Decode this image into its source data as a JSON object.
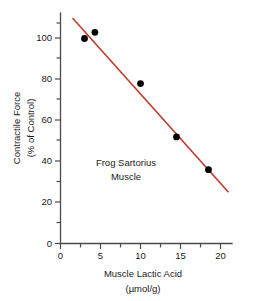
{
  "chart_data": {
    "type": "scatter",
    "title": "",
    "xlabel": "Muscle Lactic Acid",
    "xlabel_units": "(µmol/g)",
    "ylabel": "Contractile Force",
    "ylabel_units": "(% of Control)",
    "xlim": [
      0,
      21.5
    ],
    "ylim": [
      0,
      112
    ],
    "grid": false,
    "legend": "none",
    "x_ticks": [
      0,
      5,
      10,
      15,
      20
    ],
    "x_tick_labels": [
      "0",
      "5",
      "10",
      "15",
      "20"
    ],
    "x_minor_ticks": [
      2.5,
      7.5,
      12.5,
      17.5
    ],
    "y_ticks": [
      0,
      20,
      40,
      60,
      80,
      100
    ],
    "y_tick_labels": [
      "0",
      "20",
      "40",
      "60",
      "80",
      "100"
    ],
    "y_minor_ticks": [
      10,
      30,
      50,
      70,
      90,
      110
    ],
    "points": [
      {
        "x": 3.0,
        "y": 100
      },
      {
        "x": 4.3,
        "y": 103
      },
      {
        "x": 10.0,
        "y": 78
      },
      {
        "x": 14.5,
        "y": 52
      },
      {
        "x": 18.5,
        "y": 36
      }
    ],
    "point_color": "#000000",
    "point_radius_px": 3.4,
    "fit_line": {
      "x1": 1.5,
      "y1": 110,
      "x2": 21.0,
      "y2": 25,
      "color": "#c0392b"
    },
    "annotations": [
      {
        "name": "sample-label",
        "lines": [
          "Frog Sartorius",
          "Muscle"
        ],
        "x": 8.2,
        "y": 46
      }
    ]
  },
  "labels": {
    "x_axis_title": "Muscle Lactic Acid",
    "x_axis_units": "(µmol/g)",
    "y_axis_title": "Contractile Force",
    "y_axis_units": "(% of Control)",
    "annotation_line1": "Frog Sartorius",
    "annotation_line2": "Muscle"
  }
}
